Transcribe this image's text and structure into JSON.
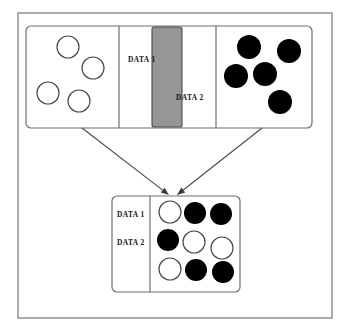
{
  "figure": {
    "type": "diagram",
    "canvas": {
      "width": 348,
      "height": 334,
      "background": "#ffffff"
    },
    "colors": {
      "background": "#ffffff",
      "outline": "#6e6e6e",
      "frame": "#8a8a8a",
      "gray_band": "#969696",
      "filled_circle": "#000000",
      "open_circle_fill": "#ffffff",
      "open_circle_stroke": "#4a4a4a",
      "text": "#121212",
      "arrow": "#4a4a4a"
    },
    "outer_frame": {
      "x": 18,
      "y": 13,
      "width": 314,
      "height": 305
    }
  },
  "labels": {
    "data1": "DATA 1",
    "data2": "DATA 2"
  },
  "top_panel": {
    "name": "input-panel",
    "x": 26,
    "y": 26,
    "width": 286,
    "height": 102,
    "dividers": [
      119,
      216
    ],
    "left_cell": {
      "name": "data1-source-cell",
      "marker_style": "open",
      "marker_count": 4,
      "markers": [
        {
          "cx": 68,
          "cy": 47,
          "r": 11
        },
        {
          "cx": 93,
          "cy": 68,
          "r": 11
        },
        {
          "cx": 48,
          "cy": 93,
          "r": 11
        },
        {
          "cx": 79,
          "cy": 101,
          "r": 11
        }
      ]
    },
    "middle_cell": {
      "name": "overlap-cell",
      "label_top": "DATA 1",
      "label_top_pos": {
        "x": 128,
        "y": 60
      },
      "label_bottom": "DATA 2",
      "label_bottom_pos": {
        "x": 176,
        "y": 98
      },
      "gray_band": {
        "x": 152,
        "y": 27,
        "width": 30,
        "height": 100
      }
    },
    "right_cell": {
      "name": "data2-source-cell",
      "marker_style": "filled",
      "marker_count": 5,
      "markers": [
        {
          "cx": 249,
          "cy": 47,
          "r": 12
        },
        {
          "cx": 289,
          "cy": 51,
          "r": 12
        },
        {
          "cx": 236,
          "cy": 76,
          "r": 12
        },
        {
          "cx": 265,
          "cy": 74,
          "r": 12
        },
        {
          "cx": 280,
          "cy": 102,
          "r": 12
        }
      ]
    }
  },
  "arrows": [
    {
      "name": "arrow-from-data1",
      "x1": 82,
      "y1": 128,
      "x2": 169,
      "y2": 195
    },
    {
      "name": "arrow-from-data2",
      "x1": 262,
      "y1": 128,
      "x2": 177,
      "y2": 195
    }
  ],
  "bottom_panel": {
    "name": "fused-output-panel",
    "x": 112,
    "y": 196,
    "width": 128,
    "height": 96,
    "divider_x": 150,
    "labels": [
      {
        "text": "DATA 1",
        "x": 117,
        "y": 215
      },
      {
        "text": "DATA 2",
        "x": 117,
        "y": 243
      }
    ],
    "grid": {
      "rows": 3,
      "cols": 3,
      "markers": [
        {
          "row": 1,
          "col": 1,
          "style": "open",
          "cx": 170,
          "cy": 212,
          "r": 11
        },
        {
          "row": 1,
          "col": 2,
          "style": "filled",
          "cx": 195,
          "cy": 213,
          "r": 11
        },
        {
          "row": 1,
          "col": 3,
          "style": "filled",
          "cx": 221,
          "cy": 214,
          "r": 11
        },
        {
          "row": 2,
          "col": 1,
          "style": "filled",
          "cx": 168,
          "cy": 240,
          "r": 11
        },
        {
          "row": 2,
          "col": 2,
          "style": "open",
          "cx": 194,
          "cy": 242,
          "r": 11
        },
        {
          "row": 2,
          "col": 3,
          "style": "open",
          "cx": 222,
          "cy": 248,
          "r": 11
        },
        {
          "row": 3,
          "col": 1,
          "style": "open",
          "cx": 170,
          "cy": 269,
          "r": 11
        },
        {
          "row": 3,
          "col": 2,
          "style": "filled",
          "cx": 196,
          "cy": 270,
          "r": 11
        },
        {
          "row": 3,
          "col": 3,
          "style": "filled",
          "cx": 223,
          "cy": 272,
          "r": 11
        }
      ]
    }
  }
}
